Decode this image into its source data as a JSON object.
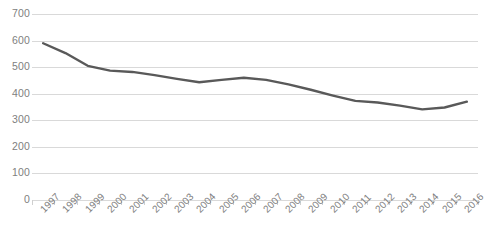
{
  "chart_data": {
    "type": "line",
    "title": "",
    "subtitle": "",
    "xlabel": "",
    "ylabel": "",
    "grid": true,
    "legend": false,
    "legend_position": "none",
    "line_color": "#595959",
    "gridline_color": "#d9d9d9",
    "label_color": "#808080",
    "background": "#ffffff",
    "ylim": [
      0,
      700
    ],
    "ytick_step": 100,
    "ytick_labels": [
      "700",
      "600",
      "500",
      "400",
      "300",
      "200",
      "100",
      "0"
    ],
    "ytick_values": [
      700,
      600,
      500,
      400,
      300,
      200,
      100,
      0
    ],
    "categories": [
      "1997",
      "1998",
      "1999",
      "2000",
      "2001",
      "2002",
      "2003",
      "2004",
      "2005",
      "2006",
      "2007",
      "2008",
      "2009",
      "2010",
      "2011",
      "2012",
      "2013",
      "2014",
      "2015",
      "2016"
    ],
    "series": [
      {
        "name": "",
        "values": [
          590,
          553,
          505,
          487,
          482,
          470,
          456,
          443,
          452,
          460,
          452,
          435,
          415,
          393,
          373,
          367,
          355,
          341,
          348,
          370
        ]
      }
    ]
  }
}
